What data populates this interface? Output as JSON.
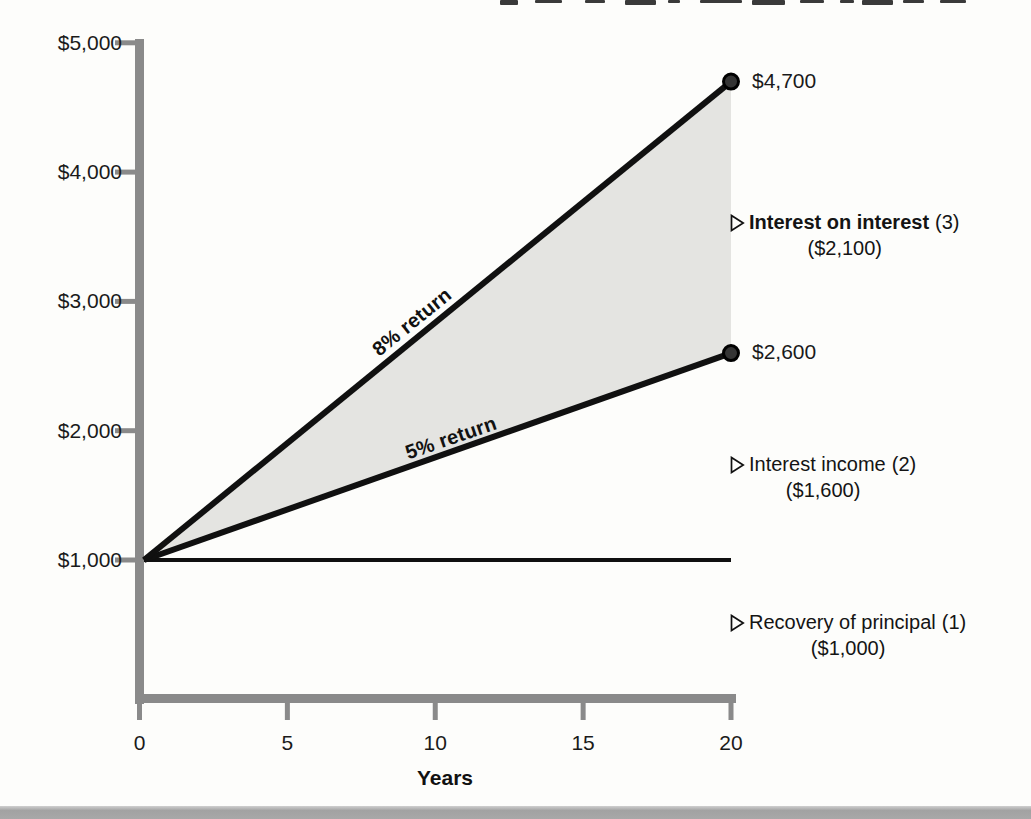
{
  "chart_data": {
    "type": "line",
    "title": "",
    "xlabel": "Years",
    "xlim": [
      0,
      20
    ],
    "ylim": [
      0,
      5000
    ],
    "x_ticks": [
      0,
      5,
      10,
      15,
      20
    ],
    "y_ticks": [
      {
        "value": 5000,
        "label": "$5,000"
      },
      {
        "value": 4000,
        "label": "$4,000"
      },
      {
        "value": 3000,
        "label": "$3,000"
      },
      {
        "value": 2000,
        "label": "$2,000"
      },
      {
        "value": 1000,
        "label": "$1,000"
      }
    ],
    "grid": false,
    "series": [
      {
        "name": "8% return",
        "x": [
          0,
          20
        ],
        "values": [
          1000,
          4700
        ],
        "end_label": "$4,700",
        "end_dot": true,
        "line_width": 6
      },
      {
        "name": "5% return",
        "x": [
          0,
          20
        ],
        "values": [
          1000,
          2600
        ],
        "end_label": "$2,600",
        "end_dot": true,
        "line_width": 6
      },
      {
        "name": "Recovery of principal line",
        "x": [
          0,
          20
        ],
        "values": [
          1000,
          1000
        ],
        "end_label": "",
        "end_dot": false,
        "line_width": 4
      }
    ],
    "shaded_region": {
      "between": [
        "8% return",
        "5% return"
      ],
      "color": "#e4e4e1"
    },
    "annotations": [
      {
        "label": "Interest on interest",
        "number": "(3)",
        "amount": "($2,100)",
        "bold": true
      },
      {
        "label": "Interest income",
        "number": "(2)",
        "amount": "($1,600)",
        "bold": false
      },
      {
        "label": "Recovery of principal",
        "number": "(1)",
        "amount": "($1,000)",
        "bold": false
      }
    ],
    "colors": {
      "line": "#101010",
      "axis": "#8a8a8a",
      "shading": "#e4e4e1",
      "dot_fill": "#343434",
      "dot_edge": "#000000",
      "bottom_band": "#a8a8a8"
    }
  }
}
